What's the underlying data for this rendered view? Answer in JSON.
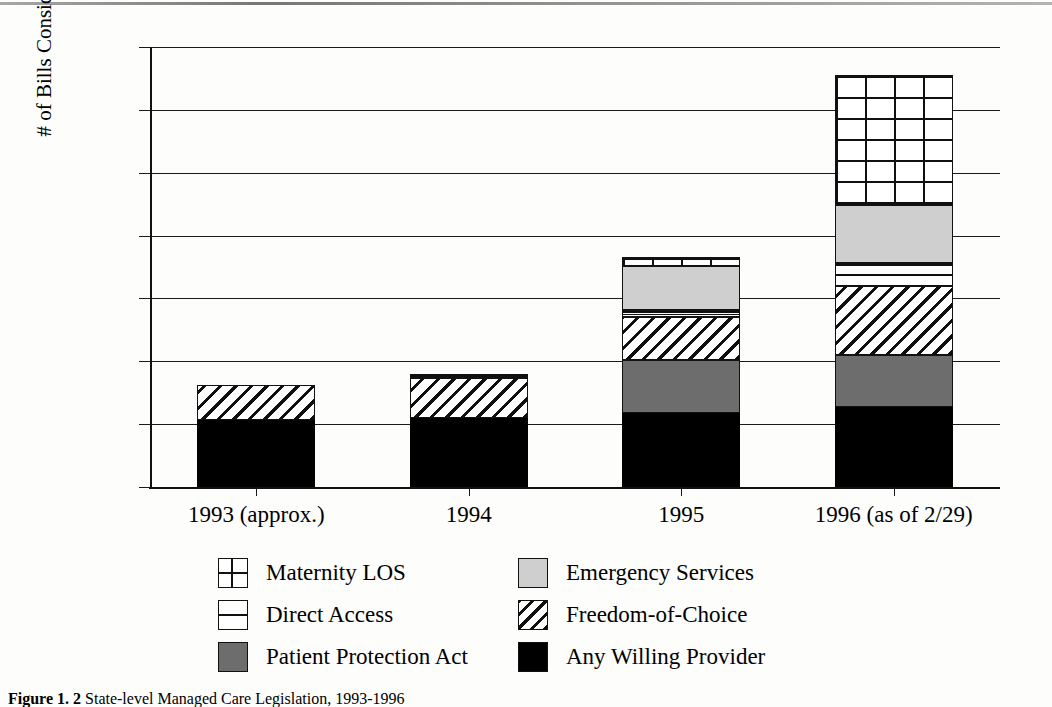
{
  "chart_data": {
    "type": "bar",
    "subtype": "stacked-bar",
    "title": "",
    "xlabel": "",
    "ylabel": "# of Bills Considered",
    "ylim": [
      0,
      350
    ],
    "ytick_step": 50,
    "yticks": [
      350,
      300,
      250,
      200,
      150,
      100,
      50,
      0
    ],
    "grid": true,
    "legend_position": "bottom",
    "categories": [
      "1993 (approx.)",
      "1994",
      "1995",
      "1996 (as of 2/29)"
    ],
    "series": [
      {
        "name": "Any Willing Provider",
        "key": "awp",
        "pattern": "solid-black",
        "values": [
          53,
          55,
          59,
          64
        ]
      },
      {
        "name": "Patient Protection Act",
        "key": "ppa",
        "pattern": "solid-dark-gray",
        "values": [
          0,
          0,
          42,
          41
        ]
      },
      {
        "name": "Freedom-of-Choice",
        "key": "foc",
        "pattern": "diagonal-hatch",
        "values": [
          28,
          32,
          34,
          55
        ]
      },
      {
        "name": "Direct Access",
        "key": "da",
        "pattern": "horizontal-lines",
        "values": [
          0,
          3,
          6,
          18
        ]
      },
      {
        "name": "Emergency Services",
        "key": "es",
        "pattern": "solid-light-gray",
        "values": [
          0,
          0,
          35,
          46
        ]
      },
      {
        "name": "Maternity LOS",
        "key": "ml",
        "pattern": "grid-crosshatch",
        "values": [
          0,
          0,
          7,
          104
        ]
      }
    ],
    "totals": [
      81,
      90,
      183,
      328
    ]
  },
  "legend": {
    "rows": [
      [
        {
          "label": "Maternity LOS",
          "swatch": "sw-ml",
          "icon": "grid-swatch-icon"
        },
        {
          "label": "Emergency Services",
          "swatch": "sw-es",
          "icon": "light-gray-swatch-icon"
        }
      ],
      [
        {
          "label": "Direct Access",
          "swatch": "sw-da",
          "icon": "horizontal-line-swatch-icon"
        },
        {
          "label": "Freedom-of-Choice",
          "swatch": "sw-foc",
          "icon": "diagonal-hatch-swatch-icon"
        }
      ],
      [
        {
          "label": "Patient Protection Act",
          "swatch": "sw-ppa",
          "icon": "dark-gray-swatch-icon"
        },
        {
          "label": "Any Willing Provider",
          "swatch": "sw-awp",
          "icon": "black-swatch-icon"
        }
      ]
    ]
  },
  "caption": {
    "label": "Figure 1. 2",
    "text": "State-level Managed Care Legislation, 1993-1996"
  },
  "colors": {
    "any_willing_provider": "#000000",
    "patient_protection_act": "#6d6d6d",
    "emergency_services": "#cfcfcf",
    "line": "#111111",
    "background": "#fdfdfb"
  }
}
